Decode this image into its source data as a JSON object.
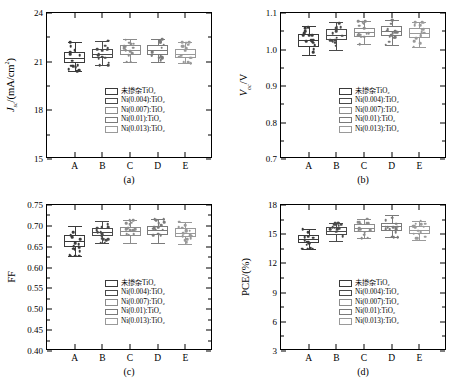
{
  "chart_data": [
    {
      "id": "a",
      "type": "box",
      "caption": "(a)",
      "ylabel": "J_sc/(mA/cm^2)",
      "ylabel_html": "<i>J</i><sub>sc</sub>/(mA/cm<sup>2</sup>)",
      "ylim": [
        15,
        24
      ],
      "yticks": [
        15,
        18,
        21,
        24
      ],
      "categories": [
        "A",
        "B",
        "C",
        "D",
        "E"
      ],
      "series": [
        {
          "name": "未掺杂TiO2",
          "group": "A",
          "median": 21.2,
          "q1": 20.9,
          "q3": 21.6,
          "whisker_low": 20.4,
          "whisker_high": 22.2
        },
        {
          "name": "Ni(0.004):TiO2",
          "group": "B",
          "median": 21.5,
          "q1": 21.2,
          "q3": 21.8,
          "whisker_low": 20.8,
          "whisker_high": 22.3
        },
        {
          "name": "Ni(0.007):TiO2",
          "group": "C",
          "median": 21.7,
          "q1": 21.4,
          "q3": 22.0,
          "whisker_low": 21.0,
          "whisker_high": 22.4
        },
        {
          "name": "Ni(0.01):TiO2",
          "group": "D",
          "median": 21.7,
          "q1": 21.4,
          "q3": 22.0,
          "whisker_low": 21.0,
          "whisker_high": 22.4
        },
        {
          "name": "Ni(0.013):TiO2",
          "group": "E",
          "median": 21.5,
          "q1": 21.2,
          "q3": 21.8,
          "whisker_low": 20.9,
          "whisker_high": 22.2
        }
      ],
      "legend": [
        "未掺杂TiO2",
        "Ni(0.004):TiO2",
        "Ni(0.007):TiO2",
        "Ni(0.01):TiO2",
        "Ni(0.013):TiO2"
      ]
    },
    {
      "id": "b",
      "type": "box",
      "caption": "(b)",
      "ylabel": "V_oc/V",
      "ylabel_html": "<i>V</i><sub>oc</sub>/V",
      "ylim": [
        0.7,
        1.1
      ],
      "yticks": [
        0.7,
        0.8,
        0.9,
        1.0,
        1.1
      ],
      "categories": [
        "A",
        "B",
        "C",
        "D",
        "E"
      ],
      "series": [
        {
          "name": "未掺杂TiO2",
          "group": "A",
          "median": 1.025,
          "q1": 1.008,
          "q3": 1.042,
          "whisker_low": 0.985,
          "whisker_high": 1.065
        },
        {
          "name": "Ni(0.004):TiO2",
          "group": "B",
          "median": 1.04,
          "q1": 1.025,
          "q3": 1.055,
          "whisker_low": 1.0,
          "whisker_high": 1.075
        },
        {
          "name": "Ni(0.007):TiO2",
          "group": "C",
          "median": 1.048,
          "q1": 1.035,
          "q3": 1.06,
          "whisker_low": 1.015,
          "whisker_high": 1.078
        },
        {
          "name": "Ni(0.01):TiO2",
          "group": "D",
          "median": 1.052,
          "q1": 1.038,
          "q3": 1.065,
          "whisker_low": 1.012,
          "whisker_high": 1.082
        },
        {
          "name": "Ni(0.013):TiO2",
          "group": "E",
          "median": 1.045,
          "q1": 1.032,
          "q3": 1.058,
          "whisker_low": 1.008,
          "whisker_high": 1.075
        }
      ],
      "legend": [
        "未掺杂TiO2",
        "Ni(0.004):TiO2",
        "Ni(0.007):TiO2",
        "Ni(0.01):TiO2",
        "Ni(0.013):TiO2"
      ]
    },
    {
      "id": "c",
      "type": "box",
      "caption": "(c)",
      "ylabel": "FF",
      "ylabel_html": "FF",
      "ylim": [
        0.4,
        0.75
      ],
      "yticks": [
        0.4,
        0.45,
        0.5,
        0.55,
        0.6,
        0.65,
        0.7,
        0.75
      ],
      "categories": [
        "A",
        "B",
        "C",
        "D",
        "E"
      ],
      "series": [
        {
          "name": "未掺杂TiO2",
          "group": "A",
          "median": 0.663,
          "q1": 0.65,
          "q3": 0.678,
          "whisker_low": 0.628,
          "whisker_high": 0.7
        },
        {
          "name": "Ni(0.004):TiO2",
          "group": "B",
          "median": 0.686,
          "q1": 0.676,
          "q3": 0.696,
          "whisker_low": 0.66,
          "whisker_high": 0.712
        },
        {
          "name": "Ni(0.007):TiO2",
          "group": "C",
          "median": 0.688,
          "q1": 0.676,
          "q3": 0.698,
          "whisker_low": 0.658,
          "whisker_high": 0.714
        },
        {
          "name": "Ni(0.01):TiO2",
          "group": "D",
          "median": 0.69,
          "q1": 0.678,
          "q3": 0.7,
          "whisker_low": 0.66,
          "whisker_high": 0.716
        },
        {
          "name": "Ni(0.013):TiO2",
          "group": "E",
          "median": 0.684,
          "q1": 0.674,
          "q3": 0.694,
          "whisker_low": 0.656,
          "whisker_high": 0.71
        }
      ],
      "legend": [
        "未掺杂TiO2",
        "Ni(0.004):TiO2",
        "Ni(0.007):TiO2",
        "Ni(0.01):TiO2",
        "Ni(0.013):TiO2"
      ]
    },
    {
      "id": "d",
      "type": "box",
      "caption": "(d)",
      "ylabel": "PCE/(%)",
      "ylabel_html": "PCE/(%)",
      "ylim": [
        3,
        18
      ],
      "yticks": [
        3,
        6,
        9,
        12,
        15,
        18
      ],
      "categories": [
        "A",
        "B",
        "C",
        "D",
        "E"
      ],
      "series": [
        {
          "name": "未掺杂TiO2",
          "group": "A",
          "median": 14.5,
          "q1": 14.1,
          "q3": 14.9,
          "whisker_low": 13.5,
          "whisker_high": 15.5
        },
        {
          "name": "Ni(0.004):TiO2",
          "group": "B",
          "median": 15.3,
          "q1": 14.9,
          "q3": 15.7,
          "whisker_low": 14.3,
          "whisker_high": 16.2
        },
        {
          "name": "Ni(0.007):TiO2",
          "group": "C",
          "median": 15.6,
          "q1": 15.2,
          "q3": 16.0,
          "whisker_low": 14.6,
          "whisker_high": 16.6
        },
        {
          "name": "Ni(0.01):TiO2",
          "group": "D",
          "median": 15.8,
          "q1": 15.3,
          "q3": 16.2,
          "whisker_low": 14.7,
          "whisker_high": 17.0
        },
        {
          "name": "Ni(0.013):TiO2",
          "group": "E",
          "median": 15.4,
          "q1": 15.0,
          "q3": 15.8,
          "whisker_low": 14.4,
          "whisker_high": 16.4
        }
      ],
      "legend": [
        "未掺杂TiO2",
        "Ni(0.004):TiO2",
        "Ni(0.007):TiO2",
        "Ni(0.01):TiO2",
        "Ni(0.013):TiO2"
      ]
    }
  ],
  "panels": {
    "a": {
      "caption": "(a)",
      "ytick_labels": [
        "15",
        "18",
        "21",
        "24"
      ],
      "xtick_labels": [
        "A",
        "B",
        "C",
        "D",
        "E"
      ],
      "legend": [
        "未掺杂TiO₂",
        "Ni(0.004):TiO₂",
        "Ni(0.007):TiO₂",
        "Ni(0.01):TiO₂",
        "Ni(0.013):TiO₂"
      ]
    },
    "b": {
      "caption": "(b)",
      "ytick_labels": [
        "0.7",
        "0.8",
        "0.9",
        "1.0",
        "1.1"
      ],
      "xtick_labels": [
        "A",
        "B",
        "C",
        "D",
        "E"
      ],
      "legend": [
        "未掺杂TiO₂",
        "Ni(0.004):TiO₂",
        "Ni(0.007):TiO₂",
        "Ni(0.01):TiO₂",
        "Ni(0.013):TiO₂"
      ]
    },
    "c": {
      "caption": "(c)",
      "ytick_labels": [
        "0.40",
        "0.45",
        "0.50",
        "0.55",
        "0.60",
        "0.65",
        "0.70",
        "0.75"
      ],
      "xtick_labels": [
        "A",
        "B",
        "C",
        "D",
        "E"
      ],
      "legend": [
        "未掺杂TiO₂",
        "Ni(0.004):TiO₂",
        "Ni(0.007):TiO₂",
        "Ni(0.01):TiO₂",
        "Ni(0.013):TiO₂"
      ]
    },
    "d": {
      "caption": "(d)",
      "ytick_labels": [
        "3",
        "6",
        "9",
        "12",
        "15",
        "18"
      ],
      "xtick_labels": [
        "A",
        "B",
        "C",
        "D",
        "E"
      ],
      "legend": [
        "未掺杂TiO₂",
        "Ni(0.004):TiO₂",
        "Ni(0.007):TiO₂",
        "Ni(0.01):TiO₂",
        "Ni(0.013):TiO₂"
      ]
    }
  },
  "colors": {
    "axis": "#000000",
    "box_outline": "#222222",
    "series_a": "#3a3a3a",
    "series_b": "#4a4a4a",
    "series_c": "#8c8c8c",
    "series_d": "#7a7a7a",
    "series_e": "#9a9a9a",
    "background": "#ffffff"
  }
}
